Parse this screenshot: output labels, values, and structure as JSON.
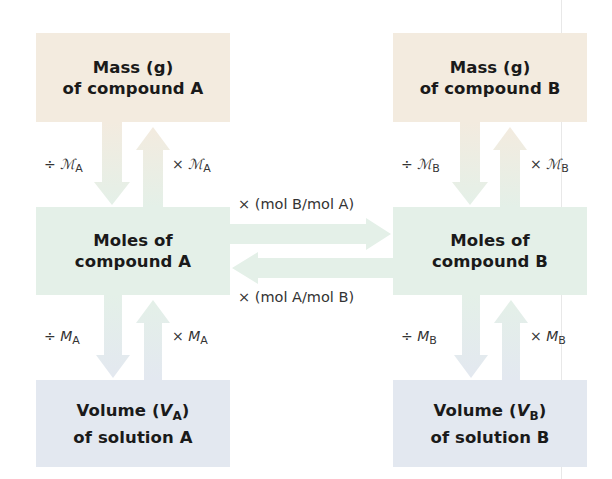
{
  "diagram": {
    "column_a": {
      "mass_box": {
        "line1": "Mass (g)",
        "line2": "of compound A"
      },
      "moles_box": {
        "line1": "Moles of",
        "line2": "compound A"
      },
      "volume_box": {
        "line1_prefix": "Volume (",
        "line1_var": "V",
        "line1_sub": "A",
        "line1_suffix": ")",
        "line2": "of solution A"
      },
      "mass_to_moles": {
        "op": "÷",
        "symbol": "ℳ",
        "sub": "A"
      },
      "moles_to_mass": {
        "op": "×",
        "symbol": "ℳ",
        "sub": "A"
      },
      "moles_to_volume": {
        "op": "÷",
        "symbol": "M",
        "sub": "A"
      },
      "volume_to_moles": {
        "op": "×",
        "symbol": "M",
        "sub": "A"
      }
    },
    "column_b": {
      "mass_box": {
        "line1": "Mass (g)",
        "line2": "of compound B"
      },
      "moles_box": {
        "line1": "Moles of",
        "line2": "compound B"
      },
      "volume_box": {
        "line1_prefix": "Volume (",
        "line1_var": "V",
        "line1_sub": "B",
        "line1_suffix": ")",
        "line2": "of solution B"
      },
      "mass_to_moles": {
        "op": "÷",
        "symbol": "ℳ",
        "sub": "B"
      },
      "moles_to_mass": {
        "op": "×",
        "symbol": "ℳ",
        "sub": "B"
      },
      "moles_to_volume": {
        "op": "÷",
        "symbol": "M",
        "sub": "B"
      },
      "volume_to_moles": {
        "op": "×",
        "symbol": "M",
        "sub": "B"
      }
    },
    "a_to_b_label": "× (mol B/mol A)",
    "b_to_a_label": "× (mol A/mol B)",
    "colors": {
      "mass": "#f3ebdf",
      "moles": "#e4f0e8",
      "volume": "#e3e8f0",
      "text": "#1a1a1a"
    }
  }
}
